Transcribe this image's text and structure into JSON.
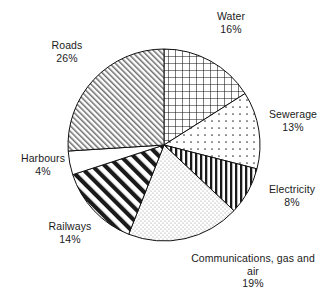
{
  "chart_data": {
    "type": "pie",
    "title": "",
    "subtitle": "",
    "xlabel": "",
    "ylabel": "",
    "legend_position": "none",
    "grid": false,
    "units": "percent",
    "total": 100,
    "start_angle_deg": 0,
    "direction": "clockwise",
    "categories": [
      "Water",
      "Sewerage",
      "Electricity",
      "Communications, gas and air",
      "Railways",
      "Harbours",
      "Roads"
    ],
    "values": [
      16,
      13,
      8,
      19,
      14,
      4,
      26
    ],
    "slices": [
      {
        "label": "Water",
        "label_line1": "Water",
        "label_line2": "",
        "value": 16,
        "percent_text": "16%",
        "fill_pattern": "cross-hatch-grid",
        "fill_color": "#ffffff",
        "line_color": "#111111"
      },
      {
        "label": "Sewerage",
        "label_line1": "Sewerage",
        "label_line2": "",
        "value": 13,
        "percent_text": "13%",
        "fill_pattern": "sparse-dots",
        "fill_color": "#ffffff",
        "line_color": "#111111"
      },
      {
        "label": "Electricity",
        "label_line1": "Electricity",
        "label_line2": "",
        "value": 8,
        "percent_text": "8%",
        "fill_pattern": "vertical-stripes",
        "fill_color": "#ffffff",
        "line_color": "#111111"
      },
      {
        "label": "Communications, gas and air",
        "label_line1": "Communications, gas and",
        "label_line2": "air",
        "value": 19,
        "percent_text": "19%",
        "fill_pattern": "fine-stipple",
        "fill_color": "#ffffff",
        "line_color": "#111111"
      },
      {
        "label": "Railways",
        "label_line1": "Railways",
        "label_line2": "",
        "value": 14,
        "percent_text": "14%",
        "fill_pattern": "bold-diagonal-stripes",
        "fill_color": "#ffffff",
        "line_color": "#111111"
      },
      {
        "label": "Harbours",
        "label_line1": "Harbours",
        "label_line2": "",
        "value": 4,
        "percent_text": "4%",
        "fill_pattern": "none-blank",
        "fill_color": "#ffffff",
        "line_color": "#111111"
      },
      {
        "label": "Roads",
        "label_line1": "Roads",
        "label_line2": "",
        "value": 26,
        "percent_text": "26%",
        "fill_pattern": "fine-diagonal-hatch",
        "fill_color": "#ffffff",
        "line_color": "#111111"
      }
    ]
  },
  "labels": {
    "water": {
      "name": "Water",
      "percent": "16%"
    },
    "sewerage": {
      "name": "Sewerage",
      "percent": "13%"
    },
    "electricity": {
      "name": "Electricity",
      "percent": "8%"
    },
    "comms": {
      "name_line1": "Communications, gas and",
      "name_line2": "air",
      "percent": "19%"
    },
    "railways": {
      "name": "Railways",
      "percent": "14%"
    },
    "harbours": {
      "name": "Harbours",
      "percent": "4%"
    },
    "roads": {
      "name": "Roads",
      "percent": "26%"
    }
  },
  "geometry": {
    "center_x": 164,
    "center_y": 145,
    "radius": 96
  },
  "colors": {
    "background": "#ffffff",
    "ink": "#111111",
    "text": "#1b1b1b"
  }
}
